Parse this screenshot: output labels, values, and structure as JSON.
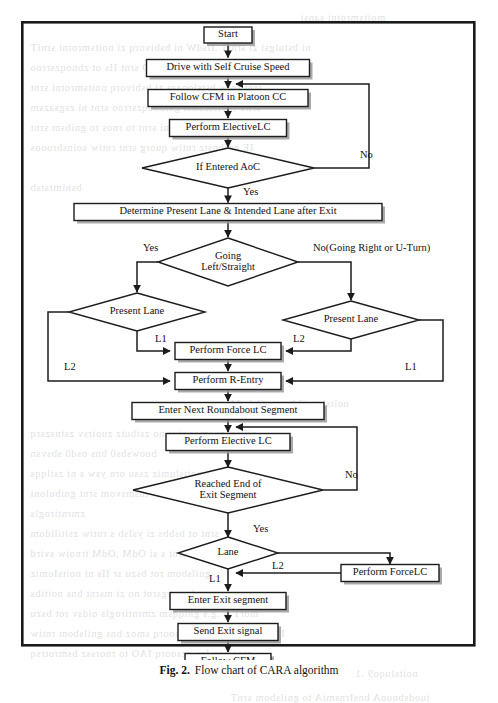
{
  "figure": {
    "caption_number": "Fig. 2.",
    "caption_text": "Flow chart of CARA algorithm",
    "frame": {
      "x": 21,
      "y": 21,
      "width": 455,
      "height": 626
    }
  },
  "chart_data": {
    "type": "diagram",
    "title": "Flow chart of CARA algorithm",
    "nodes": [
      {
        "id": "start",
        "label": "Start",
        "shape": "process",
        "cx": 228,
        "cy": 35,
        "w": 48,
        "h": 16
      },
      {
        "id": "cruise",
        "label": "Drive with Self Cruise Speed",
        "shape": "process",
        "cx": 228,
        "cy": 68,
        "w": 163,
        "h": 17
      },
      {
        "id": "followcfm",
        "label": "Follow CFM in Platoon CC",
        "shape": "process",
        "cx": 228,
        "cy": 98,
        "w": 160,
        "h": 17
      },
      {
        "id": "electivelc1",
        "label": "Perform ElectiveLC",
        "shape": "process",
        "cx": 228,
        "cy": 128,
        "w": 117,
        "h": 17
      },
      {
        "id": "aoc",
        "label": "If Entered AoC",
        "shape": "decision",
        "cx": 228,
        "cy": 168,
        "w": 172,
        "h": 40
      },
      {
        "id": "determine",
        "label": "Determine Present Lane & Intended Lane after Exit",
        "shape": "process",
        "cx": 228,
        "cy": 212,
        "w": 308,
        "h": 17
      },
      {
        "id": "going",
        "label": "Going\nLeft/Straight",
        "shape": "decision",
        "cx": 228,
        "cy": 262,
        "w": 140,
        "h": 48
      },
      {
        "id": "laneleft",
        "label": "Present Lane",
        "shape": "decision",
        "cx": 137,
        "cy": 312,
        "w": 136,
        "h": 38
      },
      {
        "id": "laneright",
        "label": "Present Lane",
        "shape": "decision",
        "cx": 351,
        "cy": 320,
        "w": 136,
        "h": 38
      },
      {
        "id": "forcelc1",
        "label": "Perform Force LC",
        "shape": "process",
        "cx": 228,
        "cy": 351,
        "w": 106,
        "h": 17
      },
      {
        "id": "rentry",
        "label": "Perform R-Entry",
        "shape": "process",
        "cx": 228,
        "cy": 381,
        "w": 106,
        "h": 17
      },
      {
        "id": "nextseg",
        "label": "Enter Next Roundabout Segment",
        "shape": "process",
        "cx": 228,
        "cy": 411,
        "w": 192,
        "h": 17
      },
      {
        "id": "electivelc2",
        "label": "Perform Elective LC",
        "shape": "process",
        "cx": 228,
        "cy": 442,
        "w": 124,
        "h": 17
      },
      {
        "id": "reached",
        "label": "Reached  End  of\nExit Segment",
        "shape": "decision",
        "cx": 228,
        "cy": 490,
        "w": 190,
        "h": 46
      },
      {
        "id": "lane",
        "label": "Lane",
        "shape": "decision",
        "cx": 228,
        "cy": 553,
        "w": 100,
        "h": 32
      },
      {
        "id": "forcelc2",
        "label": "Perform ForceLC",
        "shape": "process",
        "cx": 390,
        "cy": 573,
        "w": 98,
        "h": 17
      },
      {
        "id": "exitseg",
        "label": "Enter Exit segment",
        "shape": "process",
        "cx": 228,
        "cy": 601,
        "w": 116,
        "h": 17
      },
      {
        "id": "exitsignal",
        "label": "Send Exit signal",
        "shape": "process",
        "cx": 228,
        "cy": 632,
        "w": 100,
        "h": 17
      },
      {
        "id": "followcfm2",
        "label": "Follow CFM",
        "shape": "process",
        "cx": 228,
        "cy": 662,
        "w": 86,
        "h": 17
      }
    ],
    "edges": [
      {
        "from": "start",
        "to": "cruise",
        "label": ""
      },
      {
        "from": "cruise",
        "to": "followcfm",
        "label": ""
      },
      {
        "from": "followcfm",
        "to": "electivelc1",
        "label": ""
      },
      {
        "from": "electivelc1",
        "to": "aoc",
        "label": ""
      },
      {
        "from": "aoc",
        "to": "determine",
        "label": "Yes"
      },
      {
        "from": "aoc",
        "to": "followcfm",
        "label": "No"
      },
      {
        "from": "determine",
        "to": "going",
        "label": ""
      },
      {
        "from": "going",
        "to": "laneleft",
        "label": "Yes"
      },
      {
        "from": "going",
        "to": "laneright",
        "label": "No(Going Right or U-Turn)"
      },
      {
        "from": "laneleft",
        "to": "forcelc1",
        "label": "L1"
      },
      {
        "from": "laneleft",
        "to": "rentry",
        "label": "L2"
      },
      {
        "from": "laneright",
        "to": "forcelc1",
        "label": "L2"
      },
      {
        "from": "laneright",
        "to": "rentry",
        "label": "L1"
      },
      {
        "from": "forcelc1",
        "to": "rentry",
        "label": ""
      },
      {
        "from": "rentry",
        "to": "nextseg",
        "label": ""
      },
      {
        "from": "nextseg",
        "to": "electivelc2",
        "label": ""
      },
      {
        "from": "electivelc2",
        "to": "reached",
        "label": ""
      },
      {
        "from": "reached",
        "to": "lane",
        "label": "Yes"
      },
      {
        "from": "reached",
        "to": "electivelc2",
        "label": "No"
      },
      {
        "from": "lane",
        "to": "exitseg",
        "label": "L1"
      },
      {
        "from": "lane",
        "to": "forcelc2",
        "label": "L2"
      },
      {
        "from": "forcelc2",
        "to": "exitseg",
        "label": ""
      },
      {
        "from": "exitseg",
        "to": "exitsignal",
        "label": ""
      },
      {
        "from": "exitsignal",
        "to": "followcfm2",
        "label": ""
      }
    ],
    "edge_labels": [
      {
        "text": "No",
        "x": 360,
        "y": 156
      },
      {
        "text": "Yes",
        "x": 243,
        "y": 193
      },
      {
        "text": "Yes",
        "x": 143,
        "y": 249
      },
      {
        "text": "No(Going Right or U-Turn)",
        "x": 313,
        "y": 249
      },
      {
        "text": "L1",
        "x": 155,
        "y": 340
      },
      {
        "text": "L2",
        "x": 293,
        "y": 340
      },
      {
        "text": "L2",
        "x": 64,
        "y": 368
      },
      {
        "text": "L1",
        "x": 405,
        "y": 368
      },
      {
        "text": "No",
        "x": 345,
        "y": 476
      },
      {
        "text": "Yes",
        "x": 253,
        "y": 530
      },
      {
        "text": "L2",
        "x": 272,
        "y": 567
      },
      {
        "text": "L1",
        "x": 209,
        "y": 580
      }
    ]
  },
  "bleed_text": {
    "lines": [
      {
        "text": "moitsmrotni sansi",
        "x": 300,
        "y": 12
      },
      {
        "text": "ni bstulgsi zi srniT .tlsdW ni bsbivorq zi noitsmrotni srniT",
        "x": 30,
        "y": 42
      },
      {
        "text": "tsdt oz ,zrnoitszinummoo TSD srnt IIs ot zbnoqzsrroo",
        "x": 30,
        "y": 62
      },
      {
        "text": "srnt rniw bstsiooaas zi bsbivorq noitsmrotni srnt",
        "x": 30,
        "y": 82
      },
      {
        "text": "srnT .noitozznst gnibnoqzsrroo srnt ni zsgsazsm",
        "x": 30,
        "y": 102
      },
      {
        "text": "ni zi noitsmrotni srnt to rnos to gnibsm srnt",
        "x": 30,
        "y": 122
      },
      {
        "text": "IE gnibnstz rntiw quorg srnt rntiw soinsbrooos",
        "x": 30,
        "y": 142
      },
      {
        "text": "bsnimrstsb",
        "x": 30,
        "y": 182
      },
      {
        "text": "noitslumi2 bns gnilsboM",
        "x": 230,
        "y": 398
      },
      {
        "text": "oillsrt zuomonotus no zsibutz zuoirsv zstnszsrq",
        "x": 30,
        "y": 428
      },
      {
        "text": "boowsbs0 bns osd0 sbsvsn",
        "x": 30,
        "y": 448
      },
      {
        "text": "oimsnyb noitslumiz zssu orn ysw s ni zsilqqs",
        "x": 30,
        "y": 468
      },
      {
        "text": "tnsmsvom srnt gnibuloni",
        "x": 30,
        "y": 488
      },
      {
        "text": "zmrntirogls",
        "x": 30,
        "y": 508
      },
      {
        "text": "srnt ot bsbbs zi ysIsb s rntiw zsitilidom",
        "x": 30,
        "y": 528
      },
      {
        "text": "srnt tuodz nsrnt s si OdM ,OdM trnoiw svird",
        "x": 30,
        "y": 548
      },
      {
        "text": "gnilsbom rot bszu sr IIs ni noitsIumiz",
        "x": 30,
        "y": 568
      },
      {
        "text": "zs bnuorgsrot no zi msrnt bns noitibs",
        "x": 30,
        "y": 588
      },
      {
        "text": "mor1 .s .g.s gniqqsm zmrntirogls oidsv rot bszu",
        "x": 30,
        "y": 608
      },
      {
        "text": "IbsborG zs rnouz zszzsoorq smoz bns gnilsbom rntiw",
        "x": 30,
        "y": 628
      },
      {
        "text": "ztosjorq fns zzsoorq IAO to rnorssz bsmrotrsq",
        "x": 30,
        "y": 648
      },
      {
        "text": "noitsluqo9 .1",
        "x": 355,
        "y": 668
      },
      {
        "text": "tuodsbnuoA bnsIrnsmiA to gnilsbom srnT",
        "x": 230,
        "y": 692
      }
    ]
  }
}
